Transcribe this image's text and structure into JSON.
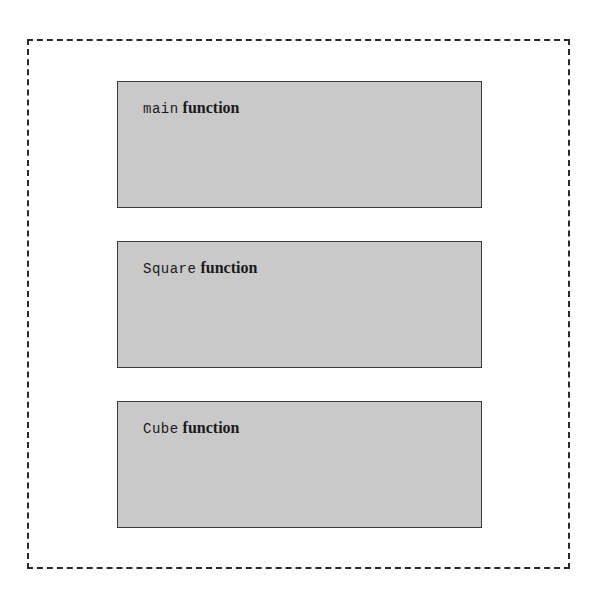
{
  "diagram": {
    "container": {
      "style": "dashed",
      "label": ""
    },
    "blocks": [
      {
        "name": "main",
        "suffix": "function"
      },
      {
        "name": "Square",
        "suffix": "function"
      },
      {
        "name": "Cube",
        "suffix": "function"
      }
    ]
  },
  "colors": {
    "block_fill": "#c9c9c9",
    "block_border": "#3a3a3a",
    "dashed_border": "#2a2a2a",
    "background": "#ffffff"
  }
}
